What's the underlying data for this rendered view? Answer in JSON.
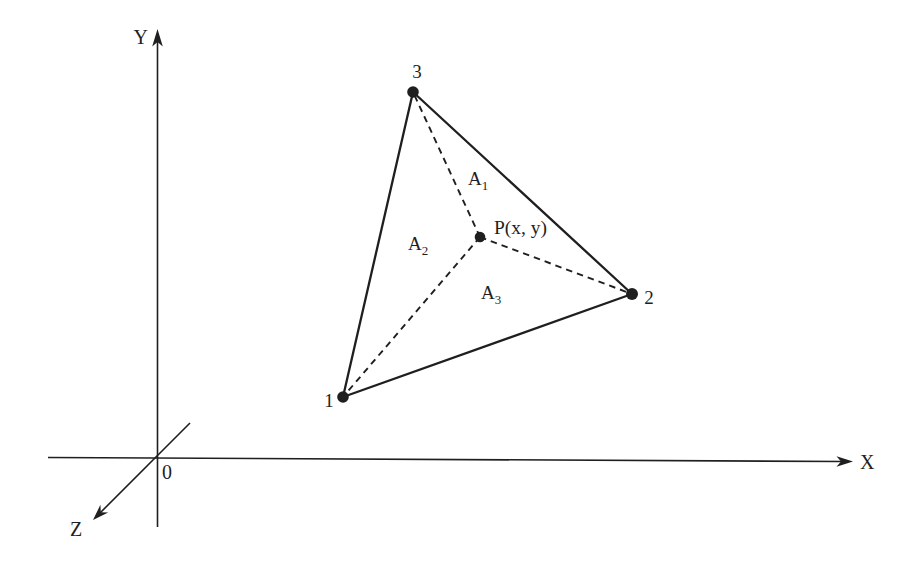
{
  "colors": {
    "ink": "#1f1f1f",
    "background": "#ffffff"
  },
  "axes": {
    "x_label": "X",
    "y_label": "Y",
    "z_label": "Z",
    "origin_label": "0"
  },
  "triangle": {
    "vertex_labels": [
      "1",
      "2",
      "3"
    ]
  },
  "point": {
    "label": "P(x, y)"
  },
  "areas": [
    {
      "base": "A",
      "sub": "1"
    },
    {
      "base": "A",
      "sub": "2"
    },
    {
      "base": "A",
      "sub": "3"
    }
  ]
}
